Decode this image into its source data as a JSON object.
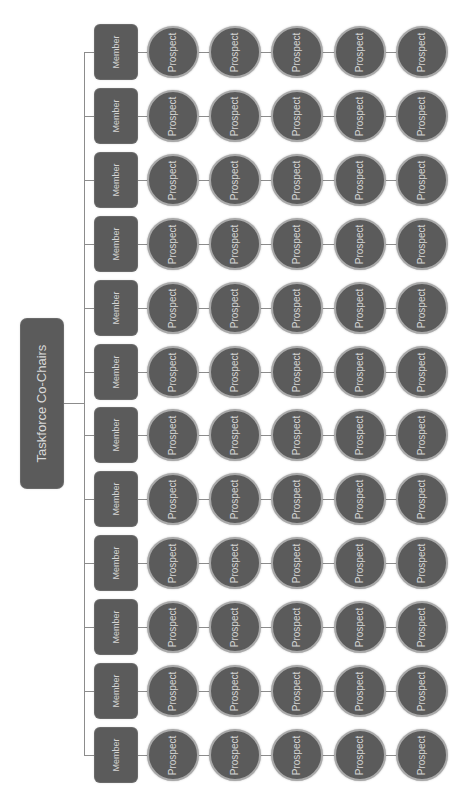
{
  "diagram": {
    "type": "org-chart",
    "orientation": "rotated-90-ccw",
    "colors": {
      "node_fill": "#5b5b5b",
      "node_text": "#d4d4d4",
      "circle_ring": "#a9a9a9",
      "connector": "#8c8c8c",
      "background": "#ffffff"
    },
    "root": {
      "label": "Taskforce Co-Chairs"
    },
    "rows": [
      {
        "member": "Member",
        "prospects": [
          "Prospect",
          "Prospect",
          "Prospect",
          "Prospect",
          "Prospect"
        ]
      },
      {
        "member": "Member",
        "prospects": [
          "Prospect",
          "Prospect",
          "Prospect",
          "Prospect",
          "Prospect"
        ]
      },
      {
        "member": "Member",
        "prospects": [
          "Prospect",
          "Prospect",
          "Prospect",
          "Prospect",
          "Prospect"
        ]
      },
      {
        "member": "Member",
        "prospects": [
          "Prospect",
          "Prospect",
          "Prospect",
          "Prospect",
          "Prospect"
        ]
      },
      {
        "member": "Member",
        "prospects": [
          "Prospect",
          "Prospect",
          "Prospect",
          "Prospect",
          "Prospect"
        ]
      },
      {
        "member": "Member",
        "prospects": [
          "Prospect",
          "Prospect",
          "Prospect",
          "Prospect",
          "Prospect"
        ]
      },
      {
        "member": "Member",
        "prospects": [
          "Prospect",
          "Prospect",
          "Prospect",
          "Prospect",
          "Prospect"
        ]
      },
      {
        "member": "Member",
        "prospects": [
          "Prospect",
          "Prospect",
          "Prospect",
          "Prospect",
          "Prospect"
        ]
      },
      {
        "member": "Member",
        "prospects": [
          "Prospect",
          "Prospect",
          "Prospect",
          "Prospect",
          "Prospect"
        ]
      },
      {
        "member": "Member",
        "prospects": [
          "Prospect",
          "Prospect",
          "Prospect",
          "Prospect",
          "Prospect"
        ]
      },
      {
        "member": "Member",
        "prospects": [
          "Prospect",
          "Prospect",
          "Prospect",
          "Prospect",
          "Prospect"
        ]
      },
      {
        "member": "Member",
        "prospects": [
          "Prospect",
          "Prospect",
          "Prospect",
          "Prospect",
          "Prospect"
        ]
      }
    ]
  }
}
